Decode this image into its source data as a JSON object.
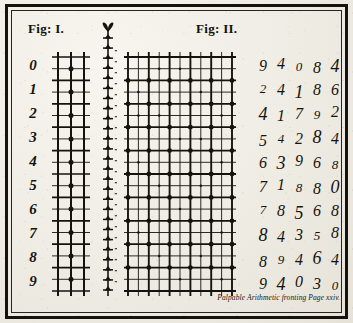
{
  "plate": {
    "caption": "Palpable Arithmetic fronting Page xxiv."
  },
  "figures": {
    "fig1": {
      "title": "Fig: I.",
      "columns": 3,
      "rows": 20
    },
    "fig2": {
      "title": "Fig: II.",
      "columns": 11,
      "rows": 20
    }
  },
  "row_labels": [
    "0",
    "1",
    "2",
    "3",
    "4",
    "5",
    "6",
    "7",
    "8",
    "9"
  ],
  "chart_data": {
    "type": "table",
    "title": "Palpable Arithmetic",
    "xlabel": "",
    "ylabel": "",
    "row_headers": [
      "0",
      "1",
      "2",
      "3",
      "4",
      "5",
      "6",
      "7",
      "8",
      "9"
    ],
    "rows": [
      [
        "9",
        "4",
        "0",
        "8",
        "4"
      ],
      [
        "2",
        "4",
        "1",
        "8",
        "6"
      ],
      [
        "4",
        "1",
        "7",
        "9",
        "2"
      ],
      [
        "5",
        "4",
        "2",
        "8",
        "4"
      ],
      [
        "6",
        "3",
        "9",
        "6",
        "8"
      ],
      [
        "7",
        "1",
        "8",
        "8",
        "0"
      ],
      [
        "7",
        "8",
        "5",
        "6",
        "8"
      ],
      [
        "8",
        "4",
        "3",
        "5",
        "8"
      ],
      [
        "8",
        "9",
        "4",
        "6",
        "4"
      ],
      [
        "9",
        "4",
        "0",
        "3",
        "0"
      ]
    ]
  },
  "colors": {
    "ink": "#16130f",
    "paper": "#efece4",
    "rule": "#2a241d"
  }
}
